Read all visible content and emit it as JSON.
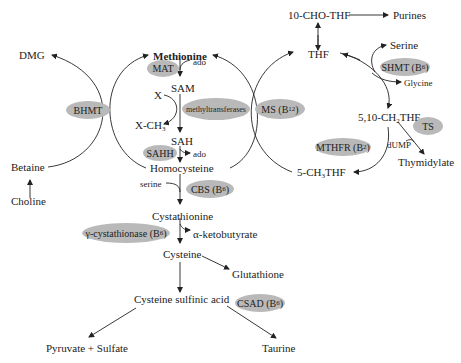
{
  "metabolites": {
    "methionine": "Methionine",
    "sam": "SAM",
    "sah": "SAH",
    "homocysteine": "Homocysteine",
    "x": "X",
    "x_ch3": "X-CH",
    "x_ch3_sub": "3",
    "ado1": "ado",
    "ado2": "ado",
    "dmg": "DMG",
    "betaine": "Betaine",
    "choline": "Choline",
    "cho_thf": "10-CHO-THF",
    "purines": "Purines",
    "thf": "THF",
    "serine_top": "Serine",
    "glycine": "Glycine",
    "ch2thf_pre": "5,10-CH",
    "ch2thf_sub": "2",
    "ch2thf_post": "THF",
    "dump": "dUMP",
    "thymidylate": "Thymidylate",
    "ch3thf_pre": "5-CH",
    "ch3thf_sub": "3",
    "ch3thf_post": "THF",
    "serine_low": "serine",
    "cystathionine": "Cystathionine",
    "ketobutyrate": "α-ketobutyrate",
    "cysteine": "Cysteine",
    "glutathione": "Glutathione",
    "cysteine_sulfinic": "Cysteine sulfinic acid",
    "pyruvate_sulfate": "Pyruvate + Sulfate",
    "taurine": "Taurine"
  },
  "enzymes": {
    "mat": "MAT",
    "methyltransferases": "methyltransferases",
    "sahh": "SAHH",
    "bhmt": "BHMT",
    "ms": "MS (B",
    "ms_sub": "12",
    "shmt": "SHMT (B",
    "shmt_sub": "6",
    "ts": "TS",
    "mthfr": "MTHFR (B",
    "mthfr_sub": "2",
    "cbs": "CBS (B",
    "cbs_sub": "6",
    "gcyst": "γ-cystathionase (B",
    "gcyst_sub": "6",
    "csad": "CSAD (B",
    "csad_sub": "6",
    "close_paren": ")"
  },
  "colors": {
    "enzyme_fill": "#b9b9b9",
    "line": "#222222"
  }
}
